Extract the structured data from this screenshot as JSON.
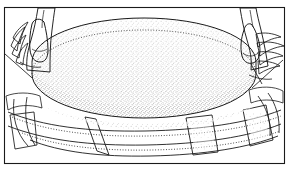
{
  "illustration": {
    "title": "Hands placing stippled oval form onto banded base",
    "style": "black-and-white stippled line drawing",
    "medium": "pen and ink technical illustration",
    "background_color": "#ffffff",
    "ink_color": "#1a1a1a",
    "stipple_color": "#555555",
    "frame": {
      "name": "illustration-border",
      "visible": true,
      "x": 4,
      "y": 7,
      "width": 281,
      "height": 157,
      "stroke_width": 1.1
    },
    "objects": [
      {
        "id": "oval-form",
        "label": "Stippled oval form",
        "description": "Large flattened ellipsoid seen in three-quarter view with dense stipple shading, darkest toward the lower band",
        "center_x": 144,
        "center_y": 62,
        "radius_x": 112,
        "radius_y": 44,
        "side_wall_height": 34,
        "fill": "#ffffff",
        "shading": "stipple"
      },
      {
        "id": "left-hand",
        "label": "Left hand",
        "description": "Hand entering from upper left, thumb pressed against the oval's left edge, fingers curled behind",
        "finger_count": 4,
        "grip_x": 40,
        "grip_y": 48
      },
      {
        "id": "right-hand",
        "label": "Right hand",
        "description": "Hand entering from upper right, thumb pressed against the oval's right edge, four fingers fanned outward",
        "finger_count": 4,
        "grip_x": 249,
        "grip_y": 48
      },
      {
        "id": "base-band",
        "label": "Banded base assembly",
        "description": "Wavy horizontal band wrapping beneath the oval, with rectangular panel tabs at left, center-left, center-right and right",
        "panel_count": 4,
        "hidden_edges": "dotted"
      }
    ],
    "line_styles": {
      "solid_outline": "solid",
      "hidden_edge": "dotted",
      "shading": "stipple dots"
    },
    "text_labels": []
  }
}
